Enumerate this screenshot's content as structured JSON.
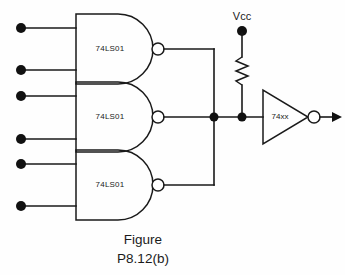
{
  "figure": {
    "caption_line1": "Figure",
    "caption_line2": "P8.12(b)",
    "type": "digital-logic-schematic"
  },
  "power": {
    "label": "Vcc",
    "terminal_name": "vcc-terminal"
  },
  "resistor": {
    "name": "pull-up-resistor",
    "label": ""
  },
  "gates": [
    {
      "id": "gate-1",
      "label": "74LS01",
      "type": "nand",
      "inputs": [
        "input-1a",
        "input-1b"
      ],
      "output": "output-1"
    },
    {
      "id": "gate-2",
      "label": "74LS01",
      "type": "nand",
      "inputs": [
        "input-2a",
        "input-2b"
      ],
      "output": "output-2"
    },
    {
      "id": "gate-3",
      "label": "74LS01",
      "type": "nand",
      "inputs": [
        "input-3a",
        "input-3b"
      ],
      "output": "output-3"
    }
  ],
  "inverter": {
    "id": "inverter-1",
    "label": "74xx",
    "type": "inverter",
    "output": "circuit-output"
  },
  "colors": {
    "background": "#fefefe",
    "line": "#1a1a1a",
    "dot": "#111111",
    "bubble_fill": "#ffffff"
  }
}
